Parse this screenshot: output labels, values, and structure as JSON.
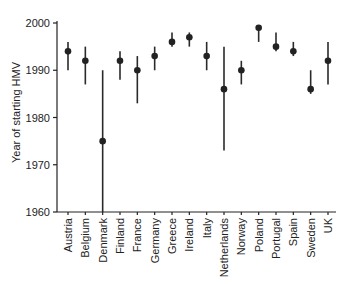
{
  "chart_data": {
    "type": "scatter",
    "title": "",
    "xlabel": "",
    "ylabel": "Year of starting HMV",
    "ylim": [
      1960,
      2000
    ],
    "yticks": [
      1960,
      1970,
      1980,
      1990,
      2000
    ],
    "grid": false,
    "legend": null,
    "categories": [
      "Austria",
      "Belgium",
      "Denmark",
      "Finland",
      "France",
      "Germany",
      "Greece",
      "Ireland",
      "Italy",
      "Netherlands",
      "Norway",
      "Poland",
      "Portugal",
      "Spain",
      "Sweden",
      "UK"
    ],
    "series": [
      {
        "name": "Year of starting HMV",
        "values": [
          1994,
          1992,
          1975,
          1992,
          1990,
          1993,
          1996,
          1997,
          1993,
          1986,
          1990,
          1999,
          1995,
          1994,
          1986,
          1992
        ],
        "error_low": [
          1990,
          1987,
          1960,
          1988,
          1983,
          1990,
          1995,
          1995,
          1990,
          1973,
          1987,
          1996,
          1994,
          1993,
          1985,
          1987
        ],
        "error_high": [
          1996,
          1995,
          1990,
          1994,
          1993,
          1995,
          1998,
          1998,
          1996,
          1995,
          1992,
          1999,
          1998,
          1996,
          1990,
          1996
        ]
      }
    ]
  }
}
